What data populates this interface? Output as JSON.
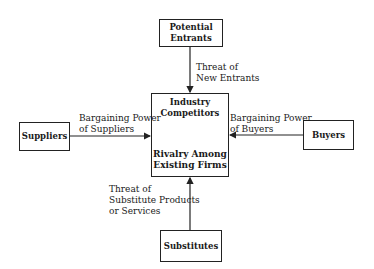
{
  "diagram": {
    "nodes": {
      "potential_entrants": {
        "line1": "Potential",
        "line2": "Entrants"
      },
      "competitors": {
        "title1": "Industry",
        "title2": "Competitors",
        "sub1": "Rivalry Among",
        "sub2": "Existing Firms"
      },
      "suppliers": {
        "label": "Suppliers"
      },
      "buyers": {
        "label": "Buyers"
      },
      "substitutes": {
        "label": "Substitutes"
      }
    },
    "edges": {
      "entrants": {
        "line1": "Threat of",
        "line2": "New Entrants"
      },
      "suppliers": {
        "line1": "Bargaining Power",
        "line2": "of Suppliers"
      },
      "buyers": {
        "line1": "Bargaining Power",
        "line2": "of Buyers"
      },
      "substitutes": {
        "line1": "Threat of",
        "line2": "Substitute Products",
        "line3": "or Services"
      }
    },
    "colors": {
      "stroke": "#222222",
      "background": "#ffffff"
    }
  }
}
